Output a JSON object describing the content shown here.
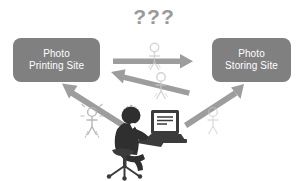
{
  "diagram": {
    "background_color": "#ffffff",
    "node_color": "#808080",
    "node_text_color": "#ffffff",
    "arrow_color": "#8c8c8c",
    "question_color": "#9a9a9a",
    "user_silhouette_color": "#3a3a3a"
  },
  "nodes": {
    "printing_site": {
      "line1": "Photo",
      "line2": "Printing Site"
    },
    "storing_site": {
      "line1": "Photo",
      "line2": "Storing Site"
    }
  },
  "annotations": {
    "question_marks": "???"
  },
  "icons": {
    "user_at_computer": "user-at-computer-icon",
    "ghost_user_center_top": "ghost-user-icon",
    "ghost_user_center_mid": "ghost-user-icon",
    "ghost_user_left": "ghost-user-icon",
    "ghost_user_right": "ghost-user-icon"
  },
  "arrows": [
    {
      "name": "printing-to-storing-arrow",
      "direction": "right",
      "from": "printing_site",
      "to": "storing_site"
    },
    {
      "name": "storing-to-printing-arrow",
      "direction": "up-left",
      "from": "storing_site",
      "to": "printing_site"
    },
    {
      "name": "user-to-printing-arrow",
      "direction": "up-left",
      "from": "user",
      "to": "printing_site"
    },
    {
      "name": "user-to-storing-arrow",
      "direction": "up-right",
      "from": "user",
      "to": "storing_site"
    }
  ]
}
